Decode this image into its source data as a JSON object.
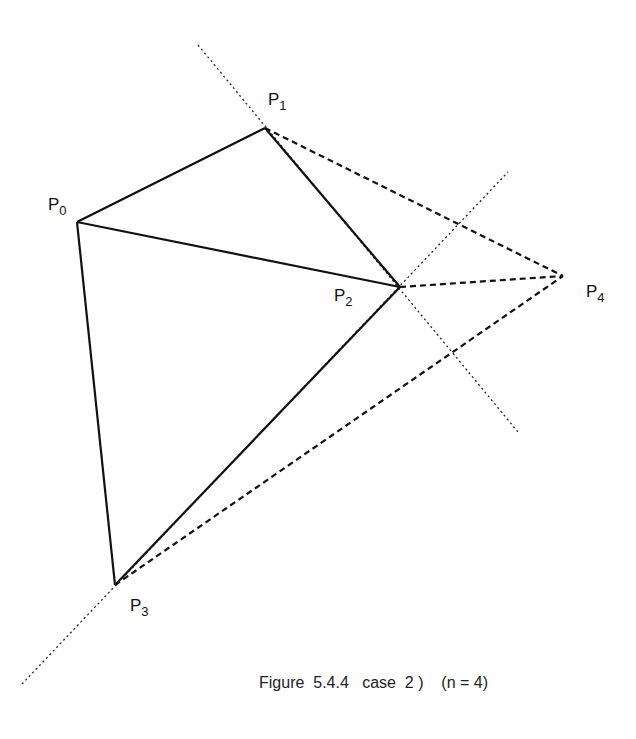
{
  "figure": {
    "caption": "Figure  5.4.4   case  2 )    (n = 4)",
    "points": [
      {
        "name": "P",
        "sub": "0",
        "x": 77,
        "y": 222
      },
      {
        "name": "P",
        "sub": "1",
        "x": 265,
        "y": 128
      },
      {
        "name": "P",
        "sub": "2",
        "x": 400,
        "y": 287
      },
      {
        "name": "P",
        "sub": "3",
        "x": 115,
        "y": 585
      },
      {
        "name": "P",
        "sub": "4",
        "x": 563,
        "y": 276
      }
    ],
    "solid_edges": [
      [
        "P0",
        "P1"
      ],
      [
        "P1",
        "P2"
      ],
      [
        "P0",
        "P2"
      ],
      [
        "P0",
        "P3"
      ],
      [
        "P2",
        "P3"
      ]
    ],
    "dashed_edges": [
      [
        "P1",
        "P4"
      ],
      [
        "P2",
        "P4"
      ],
      [
        "P3",
        "P4"
      ]
    ],
    "dotted_lines": [
      {
        "through": [
          "P1",
          "P2"
        ],
        "from": [
          198,
          45
        ],
        "to": [
          518,
          432
        ]
      },
      {
        "through": [
          "P3",
          "P2"
        ],
        "from": [
          22,
          684
        ],
        "to": [
          508,
          172
        ]
      }
    ]
  }
}
